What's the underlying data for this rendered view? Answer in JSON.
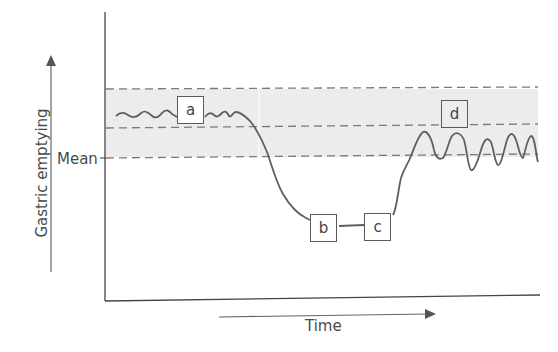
{
  "diagram": {
    "y_axis_label": "Gastric emptying",
    "x_axis_label": "Time",
    "mean_label": "Mean",
    "band": {
      "fill": "#ececec",
      "dash_color": "#7a7a7a"
    },
    "curve_color": "#5f5f5f",
    "phases": [
      {
        "id": "a",
        "label": "a",
        "description": "small irregular oscillations above mean, within upper normal band"
      },
      {
        "id": "b",
        "label": "b",
        "description": "sharp fall to low level"
      },
      {
        "id": "c",
        "label": "c",
        "description": "flat low plateau"
      },
      {
        "id": "d",
        "label": "d",
        "description": "recovery with large oscillations around upper band"
      }
    ]
  }
}
